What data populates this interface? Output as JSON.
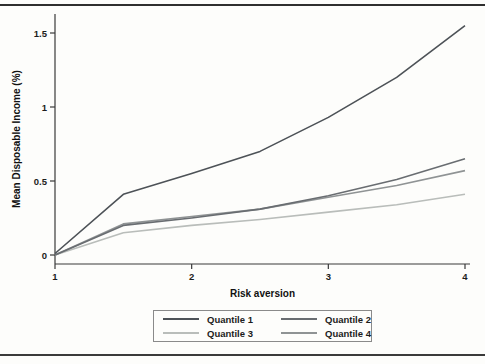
{
  "colors": {
    "axis": "#3a3a3a",
    "rule": "#2f2f2f",
    "legend_border": "#8a8a8a",
    "background": "#fdfdfb",
    "text": "#1c1c1c"
  },
  "chart_data": {
    "type": "line",
    "title": "",
    "xlabel": "Risk aversion",
    "ylabel": "Mean Disposable Income (%)",
    "xlim": [
      1,
      4
    ],
    "ylim": [
      -0.05,
      1.62
    ],
    "xticks": [
      1,
      2,
      3,
      4
    ],
    "xtick_labels": [
      "1",
      "2",
      "3",
      "4"
    ],
    "yticks": [
      0,
      0.5,
      1,
      1.5
    ],
    "ytick_labels": [
      "0",
      "0.5",
      "1",
      "1.5"
    ],
    "grid": false,
    "legend_position": "bottom",
    "x": [
      1,
      1.5,
      2,
      2.5,
      3,
      3.5,
      4
    ],
    "series": [
      {
        "name": "Quantile 1",
        "color": "#4d5257",
        "values": [
          0.01,
          0.41,
          0.55,
          0.7,
          0.93,
          1.2,
          1.55
        ]
      },
      {
        "name": "Quantile 2",
        "color": "#696d71",
        "values": [
          0.0,
          0.2,
          0.25,
          0.31,
          0.4,
          0.51,
          0.65
        ]
      },
      {
        "name": "Quantile 3",
        "color": "#b9bdba",
        "values": [
          0.0,
          0.15,
          0.2,
          0.24,
          0.29,
          0.34,
          0.41
        ]
      },
      {
        "name": "Quantile 4",
        "color": "#8f9394",
        "values": [
          0.0,
          0.21,
          0.26,
          0.31,
          0.39,
          0.47,
          0.57
        ]
      }
    ]
  }
}
